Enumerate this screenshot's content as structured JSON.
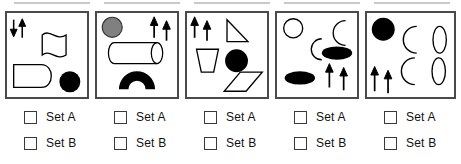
{
  "meta": {
    "panel_count": 5,
    "colors": {
      "panel_border": "#4a4a4a",
      "shape_outline": "#000000",
      "shape_fill_black": "#000000",
      "shape_fill_grey": "#808080",
      "shape_fill_white": "#ffffff",
      "checkbox_border": "#3a3a3a",
      "text": "#111111",
      "top_rule": "#c9c9c9"
    }
  },
  "panels": [
    {
      "id": "panel-1",
      "index": 1,
      "shapes": [
        {
          "name": "down-arrow",
          "fill": "black"
        },
        {
          "name": "up-arrow",
          "fill": "black"
        },
        {
          "name": "wavy-flag",
          "fill": "white"
        },
        {
          "name": "rounded-d-shape",
          "fill": "white"
        },
        {
          "name": "filled-circle",
          "fill": "black"
        }
      ],
      "checkboxes": [
        {
          "name": "set-a",
          "label": "Set A",
          "checked": false
        },
        {
          "name": "set-b",
          "label": "Set B",
          "checked": false
        }
      ]
    },
    {
      "id": "panel-2",
      "index": 2,
      "shapes": [
        {
          "name": "grey-circle",
          "fill": "grey"
        },
        {
          "name": "up-arrow",
          "fill": "black"
        },
        {
          "name": "up-arrow",
          "fill": "black"
        },
        {
          "name": "cylinder",
          "fill": "white"
        },
        {
          "name": "filled-arch",
          "fill": "black"
        }
      ],
      "checkboxes": [
        {
          "name": "set-a",
          "label": "Set A",
          "checked": false
        },
        {
          "name": "set-b",
          "label": "Set B",
          "checked": false
        }
      ]
    },
    {
      "id": "panel-3",
      "index": 3,
      "shapes": [
        {
          "name": "up-arrow",
          "fill": "black"
        },
        {
          "name": "up-arrow",
          "fill": "black"
        },
        {
          "name": "right-triangle",
          "fill": "white"
        },
        {
          "name": "trapezoid-cup",
          "fill": "white"
        },
        {
          "name": "filled-circle",
          "fill": "black"
        },
        {
          "name": "diamond",
          "fill": "white"
        }
      ],
      "checkboxes": [
        {
          "name": "set-a",
          "label": "Set A",
          "checked": false
        },
        {
          "name": "set-b",
          "label": "Set B",
          "checked": false
        }
      ]
    },
    {
      "id": "panel-4",
      "index": 4,
      "shapes": [
        {
          "name": "open-circle",
          "fill": "white"
        },
        {
          "name": "crescent-moon",
          "fill": "white"
        },
        {
          "name": "crescent-moon",
          "fill": "white"
        },
        {
          "name": "filled-ellipse",
          "fill": "black"
        },
        {
          "name": "filled-ellipse",
          "fill": "black"
        },
        {
          "name": "up-arrow",
          "fill": "black"
        },
        {
          "name": "up-arrow",
          "fill": "black"
        }
      ],
      "checkboxes": [
        {
          "name": "set-a",
          "label": "Set A",
          "checked": false
        },
        {
          "name": "set-b",
          "label": "Set B",
          "checked": false
        }
      ]
    },
    {
      "id": "panel-5",
      "index": 5,
      "shapes": [
        {
          "name": "filled-circle",
          "fill": "black"
        },
        {
          "name": "crescent-moon",
          "fill": "white"
        },
        {
          "name": "crescent-moon",
          "fill": "white"
        },
        {
          "name": "open-vertical-ellipse",
          "fill": "white"
        },
        {
          "name": "open-vertical-ellipse",
          "fill": "white"
        },
        {
          "name": "up-arrow",
          "fill": "black"
        },
        {
          "name": "up-arrow",
          "fill": "black"
        }
      ],
      "checkboxes": [
        {
          "name": "set-a",
          "label": "Set A",
          "checked": false
        },
        {
          "name": "set-b",
          "label": "Set B",
          "checked": false
        }
      ]
    }
  ]
}
